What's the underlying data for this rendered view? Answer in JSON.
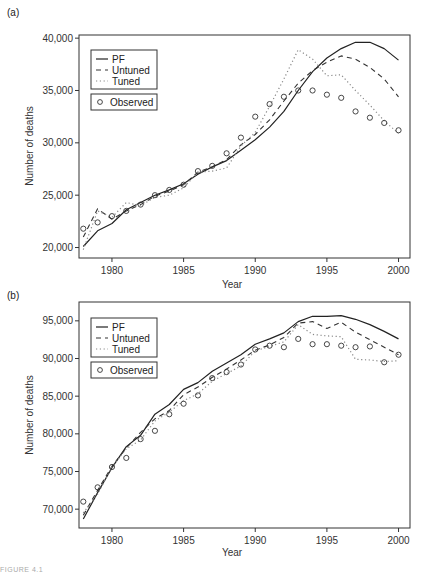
{
  "chart_data": [
    {
      "panel": "(a)",
      "type": "line",
      "title": "",
      "xlabel": "Year",
      "ylabel": "Number of deaths",
      "xlim": [
        1977.7,
        2000.8
      ],
      "ylim": [
        19000,
        40300
      ],
      "xticks": [
        1980,
        1985,
        1990,
        1995,
        2000
      ],
      "xtick_labels": [
        "1980",
        "1985",
        "1990",
        "1995",
        "2000"
      ],
      "yticks": [
        20000,
        25000,
        30000,
        35000,
        40000
      ],
      "ytick_labels": [
        "20,000",
        "25,000",
        "30,000",
        "35,000",
        "40,000"
      ],
      "grid": false,
      "legend": {
        "position": "upper-left",
        "entries": [
          "PF",
          "Untuned",
          "Tuned"
        ],
        "observed_label": "Observed"
      },
      "x": [
        1978,
        1979,
        1980,
        1981,
        1982,
        1983,
        1984,
        1985,
        1986,
        1987,
        1988,
        1989,
        1990,
        1991,
        1992,
        1993,
        1994,
        1995,
        1996,
        1997,
        1998,
        1999,
        2000
      ],
      "series": [
        {
          "name": "PF",
          "style": "solid",
          "values": [
            20100,
            21600,
            22300,
            23600,
            24300,
            25000,
            25500,
            26100,
            27000,
            27700,
            28300,
            29300,
            30300,
            31500,
            33000,
            35000,
            36800,
            38100,
            39000,
            39600,
            39600,
            39000,
            37900
          ]
        },
        {
          "name": "Untuned",
          "style": "dashed",
          "values": [
            21000,
            23700,
            22700,
            23500,
            24100,
            24900,
            25400,
            26000,
            27200,
            27700,
            28400,
            29800,
            30800,
            32200,
            34000,
            35700,
            36900,
            37700,
            38300,
            38000,
            37200,
            36100,
            34400
          ]
        },
        {
          "name": "Tuned",
          "style": "dotted",
          "values": [
            19800,
            23500,
            22900,
            24300,
            24000,
            24800,
            25000,
            25700,
            27200,
            27300,
            27600,
            29700,
            31000,
            33500,
            36100,
            38900,
            38000,
            36400,
            36500,
            35000,
            33600,
            32100,
            30900
          ]
        },
        {
          "name": "Observed",
          "style": "markers-circle",
          "values": [
            21800,
            22400,
            23000,
            23500,
            24100,
            25000,
            25500,
            26000,
            27300,
            27800,
            29000,
            30500,
            32500,
            33700,
            34400,
            35000,
            35000,
            34600,
            34300,
            33000,
            32400,
            31900,
            31200
          ]
        }
      ]
    },
    {
      "panel": "(b)",
      "type": "line",
      "title": "",
      "xlabel": "Year",
      "ylabel": "Number of deaths",
      "xlim": [
        1977.7,
        2000.8
      ],
      "ylim": [
        67500,
        97500
      ],
      "xticks": [
        1980,
        1985,
        1990,
        1995,
        2000
      ],
      "xtick_labels": [
        "1980",
        "1985",
        "1990",
        "1995",
        "2000"
      ],
      "yticks": [
        70000,
        75000,
        80000,
        85000,
        90000,
        95000
      ],
      "ytick_labels": [
        "70,000",
        "75,000",
        "80,000",
        "85,000",
        "90,000",
        "95,000"
      ],
      "grid": false,
      "legend": {
        "position": "upper-left",
        "entries": [
          "PF",
          "Untuned",
          "Tuned"
        ],
        "observed_label": "Observed"
      },
      "x": [
        1978,
        1979,
        1980,
        1981,
        1982,
        1983,
        1984,
        1985,
        1986,
        1987,
        1988,
        1989,
        1990,
        1991,
        1992,
        1993,
        1994,
        1995,
        1996,
        1997,
        1998,
        1999,
        2000
      ],
      "series": [
        {
          "name": "PF",
          "style": "solid",
          "values": [
            68700,
            72200,
            75500,
            78300,
            79800,
            82600,
            83900,
            85900,
            86800,
            88300,
            89400,
            90500,
            91900,
            92600,
            93400,
            94900,
            95600,
            95600,
            95700,
            95200,
            94500,
            93600,
            92600
          ]
        },
        {
          "name": "Untuned",
          "style": "dashed",
          "values": [
            69200,
            72500,
            75700,
            78100,
            80200,
            82000,
            83100,
            85200,
            86200,
            87500,
            88600,
            89800,
            91100,
            91800,
            92800,
            94700,
            94900,
            94000,
            94800,
            93500,
            92500,
            91500,
            90500
          ]
        },
        {
          "name": "Tuned",
          "style": "dotted",
          "values": [
            69500,
            72000,
            75600,
            78000,
            79200,
            81700,
            82900,
            84400,
            85300,
            87000,
            88000,
            89000,
            91000,
            91600,
            92200,
            94500,
            93200,
            93000,
            92900,
            89900,
            89800,
            89600,
            89700
          ]
        },
        {
          "name": "Observed",
          "style": "markers-circle",
          "values": [
            71000,
            72900,
            75600,
            76800,
            79300,
            80400,
            82600,
            84000,
            85100,
            87400,
            88200,
            89200,
            91200,
            91700,
            91500,
            92600,
            91900,
            91900,
            91700,
            91500,
            91600,
            89500,
            90500
          ]
        }
      ]
    }
  ],
  "figure": {
    "panel_a_label": "(a)",
    "panel_b_label": "(b)",
    "caption": "FIGURE 4.1"
  }
}
